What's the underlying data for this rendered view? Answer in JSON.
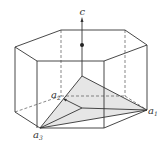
{
  "diagram": {
    "labels": {
      "c": "c",
      "a1": "a",
      "a1_sub": "1",
      "a2": "a",
      "a2_sub": "2",
      "a3": "a",
      "a3_sub": "3"
    },
    "colors": {
      "edge": "#333333",
      "hidden_edge": "#555555",
      "plane_fill": "#e6e6e6",
      "background": "#ffffff"
    }
  }
}
